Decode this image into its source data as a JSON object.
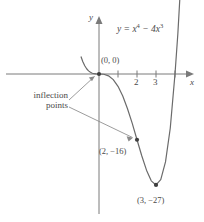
{
  "figure": {
    "background_color": "#ffffff",
    "stroke_color": "#6b6b6b",
    "text_color": "#4a4a4a"
  },
  "labels": {
    "y_axis": "y",
    "x_axis": "x",
    "equation_lhs": "y = x",
    "equation_exp1": "4",
    "equation_mid": " − 4x",
    "equation_exp2": "3",
    "equation_full": "y = x⁴ − 4x³",
    "origin_point": "(0, 0)",
    "inflection_line1": "inflection",
    "inflection_line2": "points",
    "point_inflection2": "(2, −16)",
    "point_minimum": "(3, −27)"
  },
  "chart_data": {
    "type": "line",
    "title": "",
    "function": "y = x^4 - 4x^3",
    "xlabel": "x",
    "ylabel": "y",
    "xlim": [
      -1.0,
      4.6
    ],
    "ylim": [
      -30,
      12
    ],
    "grid": false,
    "legend": "none",
    "x_ticks": [
      1,
      2,
      3,
      4
    ],
    "x_tick_labels": [
      "",
      "2",
      "3",
      ""
    ],
    "y_ticks": [],
    "y_tick_labels": [],
    "annotations": [
      {
        "label": "(0, 0)",
        "x": 0,
        "y": 0,
        "kind": "inflection-point",
        "marker": "dot"
      },
      {
        "label": "(2, −16)",
        "x": 2,
        "y": -16,
        "kind": "inflection-point",
        "marker": "dot"
      },
      {
        "label": "(3, −27)",
        "x": 3,
        "y": -27,
        "kind": "minimum",
        "marker": "dot"
      },
      {
        "label": "inflection points",
        "kind": "callout",
        "targets": [
          [
            0,
            0
          ],
          [
            2,
            -16
          ]
        ]
      }
    ],
    "series": [
      {
        "name": "y = x^4 - 4x^3",
        "x": [
          -0.95,
          -0.85,
          -0.75,
          -0.65,
          -0.55,
          -0.45,
          -0.35,
          -0.25,
          -0.15,
          -0.05,
          0.0,
          0.25,
          0.5,
          0.75,
          1.0,
          1.25,
          1.5,
          1.75,
          2.0,
          2.25,
          2.5,
          2.75,
          3.0,
          3.25,
          3.5,
          3.75,
          4.0,
          4.15,
          4.3,
          4.4,
          4.5
        ],
        "y": [
          4.24,
          2.98,
          2.0,
          1.28,
          0.76,
          0.41,
          0.19,
          0.07,
          0.014,
          0.0005,
          0.0,
          -0.059,
          -0.44,
          -1.37,
          -3.0,
          -5.37,
          -8.44,
          -12.0,
          -16.0,
          -19.9,
          -23.4,
          -26.0,
          -27.0,
          -25.7,
          -21.4,
          -13.2,
          0.0,
          9.8,
          22.1,
          31.0,
          42.2
        ]
      }
    ]
  }
}
